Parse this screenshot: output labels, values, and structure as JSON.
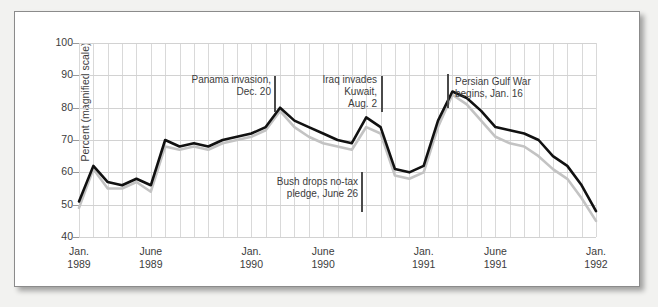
{
  "chart_data": {
    "type": "line",
    "title": "",
    "xlabel": "",
    "ylabel": "Percent (magnified scale)",
    "ylim": [
      40,
      100
    ],
    "yticks": [
      40,
      50,
      60,
      70,
      80,
      90,
      100
    ],
    "grid": true,
    "legend": "none",
    "x_tick_labels": [
      {
        "line1": "Jan.",
        "line2": "1989",
        "x_index": 0
      },
      {
        "line1": "June",
        "line2": "1989",
        "x_index": 5
      },
      {
        "line1": "Jan.",
        "line2": "1990",
        "x_index": 12
      },
      {
        "line1": "June",
        "line2": "1990",
        "x_index": 17
      },
      {
        "line1": "Jan.",
        "line2": "1991",
        "x_index": 24
      },
      {
        "line1": "June",
        "line2": "1991",
        "x_index": 29
      },
      {
        "line1": "Jan.",
        "line2": "1992",
        "x_index": 36
      }
    ],
    "x": [
      0,
      1,
      2,
      3,
      4,
      5,
      6,
      7,
      8,
      9,
      10,
      11,
      12,
      13,
      14,
      15,
      16,
      17,
      18,
      19,
      20,
      21,
      22,
      23,
      24,
      25,
      26,
      27,
      28,
      29,
      30,
      31,
      32,
      33,
      34,
      35,
      36
    ],
    "series": [
      {
        "name": "approval-black",
        "color": "#111111",
        "values": [
          51,
          62,
          57,
          56,
          58,
          56,
          70,
          68,
          69,
          68,
          70,
          71,
          72,
          74,
          80,
          76,
          74,
          72,
          70,
          69,
          77,
          74,
          61,
          60,
          62,
          76,
          85,
          83,
          79,
          74,
          73,
          72,
          70,
          65,
          62,
          56,
          48
        ]
      },
      {
        "name": "approval-gray",
        "color": "#c3c3c3",
        "values": [
          49,
          61,
          55,
          55,
          57,
          54,
          68,
          67,
          68,
          67,
          69,
          70,
          71,
          73,
          79,
          74,
          71,
          69,
          68,
          67,
          74,
          72,
          59,
          58,
          60,
          74,
          84,
          81,
          76,
          71,
          69,
          68,
          65,
          61,
          58,
          52,
          45
        ]
      }
    ],
    "annotations": [
      {
        "id": "panama",
        "text": "Panama invasion,\nDec. 20",
        "align": "right",
        "label_left": 168,
        "label_top": 62,
        "label_width": 88,
        "bar_left": 259,
        "bar_top": 64,
        "bar_height": 36
      },
      {
        "id": "iraq-invades-kuwait",
        "text": "Iraq invades\nKuwait,\nAug. 2",
        "align": "right",
        "label_left": 288,
        "label_top": 62,
        "label_width": 74,
        "bar_left": 366,
        "bar_top": 64,
        "bar_height": 36
      },
      {
        "id": "bush-no-tax-pledge",
        "text": "Bush drops no-tax\npledge, June 26",
        "align": "right",
        "label_left": 243,
        "label_top": 164,
        "label_width": 100,
        "bar_left": 346,
        "bar_top": 160,
        "bar_height": 40
      },
      {
        "id": "persian-gulf-war",
        "text": "Persian Gulf War\nbegins, Jan. 16",
        "align": "left",
        "label_left": 440,
        "label_top": 64,
        "label_width": 110,
        "bar_left": 432,
        "bar_top": 62,
        "bar_height": 34
      }
    ]
  },
  "colors": {
    "line_primary": "#111111",
    "line_secondary": "#c3c3c3",
    "grid": "#d9d9d9",
    "text": "#3c3c3c",
    "frame": "#8b8b8b",
    "page_background": "#f2f2f0"
  }
}
